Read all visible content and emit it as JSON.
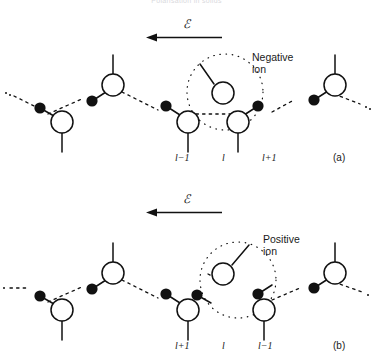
{
  "header": {
    "running_title": "Polarisation in solids"
  },
  "figure": {
    "panels": [
      {
        "id": "a",
        "panel_label": "(a)",
        "field_label": "ℰ",
        "field_arrow_direction": "left",
        "callout": {
          "line1": "Negative",
          "line2": "ion",
          "name": "negative-ion"
        },
        "site_labels": [
          "l−1",
          "l",
          "l+1"
        ]
      },
      {
        "id": "b",
        "panel_label": "(b)",
        "field_label": "ℰ",
        "field_arrow_direction": "left",
        "callout": {
          "line1": "Positive",
          "line2": "ion",
          "name": "positive-ion"
        },
        "site_labels": [
          "l+1",
          "l",
          "l−1"
        ]
      }
    ],
    "legend_semantics": {
      "open_circle": "negative ion",
      "filled_circle": "positive ion",
      "dashed_line": "weak bond",
      "solid_line": "strong bond",
      "dotted_circle": "highlighted defect site"
    }
  },
  "colors": {
    "ink": "#111111",
    "background": "#ffffff",
    "header_text": "#d9d9dd"
  }
}
